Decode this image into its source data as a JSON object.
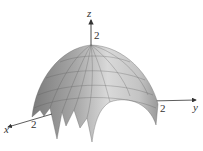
{
  "figure": {
    "type": "3d-surface",
    "axes": {
      "x": {
        "label": "x",
        "tick": "2"
      },
      "y": {
        "label": "y",
        "tick": "2"
      },
      "z": {
        "label": "z",
        "tick": "2"
      }
    },
    "colors": {
      "surface_light": "#d8d8d8",
      "surface_dark": "#6e6e6e",
      "grid": "#555555",
      "axis": "#333333"
    }
  }
}
